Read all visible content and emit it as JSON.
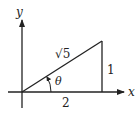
{
  "diagram": {
    "axes": {
      "x_label": "x",
      "y_label": "y"
    },
    "triangle": {
      "hypotenuse_label": "√5",
      "vertical_leg_label": "1",
      "horizontal_leg_label": "2",
      "angle_label": "θ"
    }
  }
}
